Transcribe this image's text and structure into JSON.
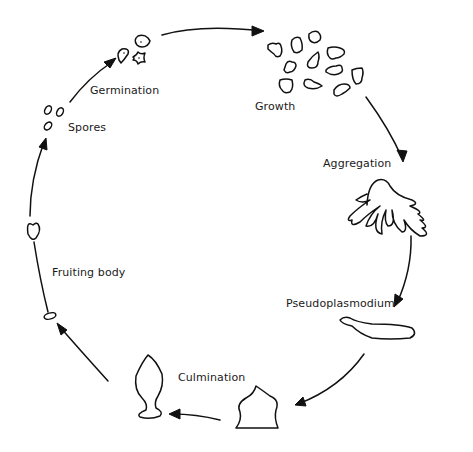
{
  "diagram": {
    "title": "",
    "type": "life-cycle",
    "stages": [
      {
        "id": "germination",
        "label": "Germination"
      },
      {
        "id": "growth",
        "label": "Growth"
      },
      {
        "id": "aggregation",
        "label": "Aggregation"
      },
      {
        "id": "pseudoplasmodium",
        "label": "Pseudoplasmodium"
      },
      {
        "id": "culmination",
        "label": "Culmination"
      },
      {
        "id": "fruiting_body",
        "label": "Fruiting body"
      },
      {
        "id": "spores",
        "label": "Spores"
      }
    ],
    "flow": [
      "spores",
      "germination",
      "growth",
      "aggregation",
      "pseudoplasmodium",
      "culmination",
      "fruiting_body",
      "spores"
    ],
    "colors": {
      "stroke": "#111111",
      "background": "#ffffff",
      "text": "#1a1a1a"
    }
  }
}
